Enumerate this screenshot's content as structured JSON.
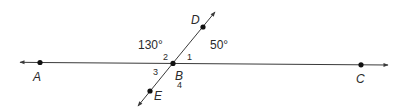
{
  "diagram": {
    "points": {
      "A": {
        "label": "A"
      },
      "B": {
        "label": "B"
      },
      "C": {
        "label": "C"
      },
      "D": {
        "label": "D"
      },
      "E": {
        "label": "E"
      }
    },
    "angle_measures": {
      "left_upper": "130°",
      "right_upper": "50°"
    },
    "angle_numbers": {
      "n1": "1",
      "n2": "2",
      "n3": "3",
      "n4": "4"
    },
    "colors": {
      "line": "#3a3a3a",
      "point": "#111111",
      "text": "#2a2a2a"
    }
  }
}
